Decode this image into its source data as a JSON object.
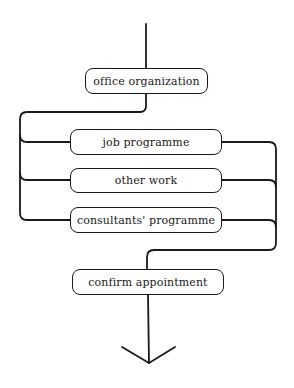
{
  "diagram": {
    "type": "flowchart",
    "colors": {
      "stroke": "#1a1a1a",
      "background": "#ffffff"
    },
    "nodes": [
      {
        "id": "office",
        "label": "office organization"
      },
      {
        "id": "job",
        "label": "job programme"
      },
      {
        "id": "other",
        "label": "other work"
      },
      {
        "id": "consultants",
        "label": "consultants' programme"
      },
      {
        "id": "confirm",
        "label": "confirm appointment"
      }
    ],
    "edges": [
      {
        "from": "start",
        "to": "office"
      },
      {
        "from": "office",
        "to": "job"
      },
      {
        "from": "office",
        "to": "other"
      },
      {
        "from": "office",
        "to": "consultants"
      },
      {
        "from": "job",
        "to": "confirm"
      },
      {
        "from": "other",
        "to": "confirm"
      },
      {
        "from": "consultants",
        "to": "confirm"
      },
      {
        "from": "confirm",
        "to": "end",
        "arrow": "down"
      }
    ]
  }
}
